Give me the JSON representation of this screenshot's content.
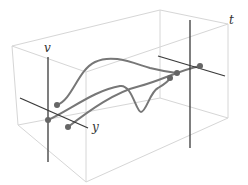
{
  "diagram": {
    "title": "",
    "colors": {
      "box": "#d6d6d6",
      "axis": "#3a3a3a",
      "curve": "#777777",
      "point": "#666666",
      "label": "#333333"
    },
    "labels": {
      "v": "v",
      "y": "y",
      "t": "t"
    },
    "box": {
      "top_face": [
        [
          12,
          46
        ],
        [
          86,
          72
        ],
        [
          228,
          24
        ],
        [
          160,
          10
        ]
      ],
      "bottom_face": [
        [
          18,
          125
        ],
        [
          86,
          182
        ],
        [
          228,
          118
        ],
        [
          160,
          98
        ]
      ]
    },
    "left_frame": {
      "v_axis": [
        [
          48,
          57
        ],
        [
          48,
          162
        ]
      ],
      "y_axis": [
        [
          20,
          98
        ],
        [
          88,
          128
        ]
      ],
      "points": [
        [
          57,
          105
        ],
        [
          48,
          120
        ],
        [
          68,
          127
        ]
      ]
    },
    "right_frame": {
      "v_axis": [
        [
          190,
          20
        ],
        [
          190,
          148
        ]
      ],
      "y_axis": [
        [
          158,
          56
        ],
        [
          225,
          76
        ]
      ],
      "points": [
        [
          177,
          73
        ],
        [
          170,
          78
        ],
        [
          200,
          66
        ]
      ]
    },
    "curves": [
      {
        "name": "curve-1",
        "path": "M57,105 C72,100 78,70 95,62 C112,54 130,62 150,68 C162,71 170,72 177,73"
      },
      {
        "name": "curve-2",
        "path": "M48,120 C70,110 95,90 120,86 C132,84 136,112 141,112 C146,112 150,92 158,88 C165,84 168,82 170,78"
      },
      {
        "name": "curve-3",
        "path": "M68,127 C90,110 115,92 140,86 C160,81 180,70 200,66"
      }
    ]
  }
}
